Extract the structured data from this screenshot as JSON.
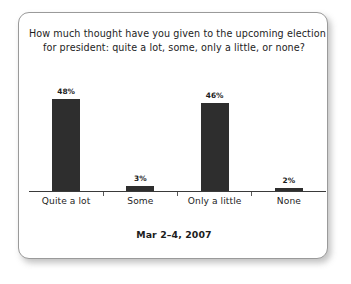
{
  "card": {
    "title_line1": "How much thought have you given to the upcoming election",
    "title_line2": "for president: quite a lot, some, only a little, or none?",
    "footer_date": "Mar 2–4, 2007"
  },
  "chart_data": {
    "type": "bar",
    "title": "How much thought have you given to the upcoming election for president: quite a lot, some, only a little, or none?",
    "subtitle": "Mar 2–4, 2007",
    "categories": [
      "Quite a lot",
      "Some",
      "Only a little",
      "None"
    ],
    "values": [
      48,
      3,
      46,
      2
    ],
    "value_labels": [
      "48%",
      "3%",
      "46%",
      "2%"
    ],
    "xlabel": "",
    "ylabel": "",
    "ylim": [
      0,
      52
    ],
    "grid": false,
    "legend": false,
    "bar_color": "#2e2e2e",
    "axis_color": "#3a3a3a",
    "text_color": "#1d1d1d"
  }
}
